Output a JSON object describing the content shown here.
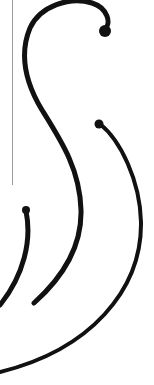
{
  "artwork": {
    "background": "#ffffff",
    "stroke_color": "#111111",
    "guide_line_color": "#9a9a9a",
    "strokes": [
      {
        "name": "large-s-curve",
        "d": "M104,30 C112,24 108,8 92,3 C70,-4 40,6 30,28 C20,52 24,80 42,110 C62,142 80,170 81,210 C82,248 62,278 34,303",
        "width": 5
      },
      {
        "name": "right-arc",
        "d": "M100,124 C120,140 140,180 141,222 C142,290 90,350 0,372",
        "width": 4
      },
      {
        "name": "small-left-arc",
        "d": "M26,211 C32,240 24,275 0,305",
        "width": 5
      }
    ],
    "bulbs": [
      {
        "name": "top-bulb",
        "cx": 105,
        "cy": 31,
        "r": 6
      },
      {
        "name": "right-bulb",
        "cx": 99,
        "cy": 124,
        "r": 4.5
      },
      {
        "name": "left-bulb",
        "cx": 26,
        "cy": 210,
        "r": 4
      }
    ]
  }
}
